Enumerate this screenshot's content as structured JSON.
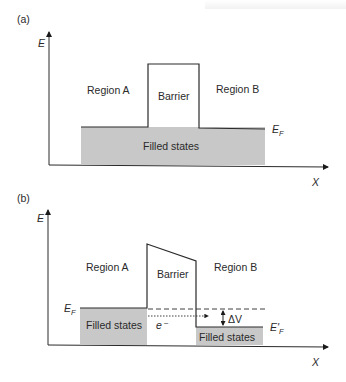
{
  "panels": [
    {
      "label": "(a)",
      "axes": {
        "y_label": "E",
        "x_label": "X"
      },
      "regions": {
        "left": "Region A",
        "barrier": "Barrier",
        "right": "Region B"
      },
      "fill_label": "Filled states",
      "fermi_label": "E",
      "fermi_sub": "F"
    },
    {
      "label": "(b)",
      "axes": {
        "y_label": "E",
        "x_label": "X"
      },
      "regions": {
        "left": "Region A",
        "barrier": "Barrier",
        "right": "Region B"
      },
      "fill_left_label": "Filled states",
      "fill_right_label": "Filled states",
      "fermi_left_label": "E",
      "fermi_left_sub": "F",
      "fermi_right_label": "E'",
      "fermi_right_sub": "F",
      "electron_label": "e⁻",
      "delta_label": "ΔV"
    }
  ],
  "colors": {
    "fill": "#c8c8c8",
    "line": "#2a2a2a"
  }
}
